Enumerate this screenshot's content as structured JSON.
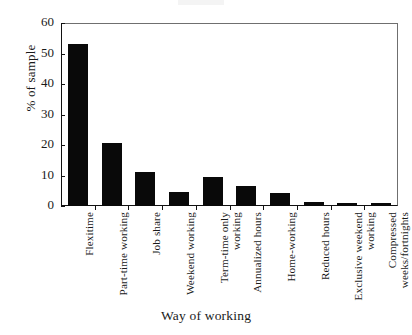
{
  "chart_data": {
    "type": "bar",
    "title": "",
    "xlabel": "Way of working",
    "ylabel": "% of sample",
    "ylim": [
      0,
      60
    ],
    "yticks": [
      0,
      10,
      20,
      30,
      40,
      50,
      60
    ],
    "ytick_labels": [
      "0",
      "10",
      "20",
      "30",
      "40",
      "50",
      "60"
    ],
    "grid": false,
    "legend": false,
    "orientation": "vertical",
    "bar_color": "#090909",
    "categories": [
      "Flexitime",
      "Part-time working",
      "Job share",
      "Weekend working",
      "Term-time only\nworking",
      "Annualized hours",
      "Home-working",
      "Reduced hours",
      "Exclusive weekend\nworking",
      "Compressed\nweeks/fortnights"
    ],
    "values": [
      53,
      20.6,
      11,
      4.7,
      9.6,
      6.4,
      4.1,
      1.2,
      1.1,
      1.1
    ]
  },
  "axes": {
    "ylabel": "% of sample",
    "xlabel": "Way of working"
  }
}
